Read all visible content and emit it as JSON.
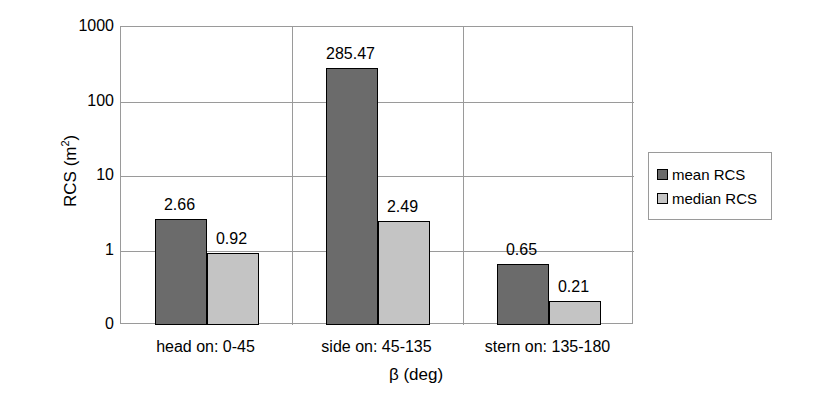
{
  "chart_data": {
    "type": "bar",
    "title": "",
    "xlabel": "β (deg)",
    "ylabel": "RCS (m²)",
    "ylabel_base": "RCS (m",
    "ylabel_sup": "2",
    "ylabel_close": ")",
    "yscale": "log",
    "ylim": [
      0,
      1000
    ],
    "yticks": [
      "1000",
      "100",
      "10",
      "1",
      "0"
    ],
    "ytick_values": [
      1000,
      100,
      10,
      1,
      0
    ],
    "grid": true,
    "legend_position": "right",
    "categories": [
      "head on:  0-45",
      "side on: 45-135",
      "stern on: 135-180"
    ],
    "series": [
      {
        "name": "mean RCS",
        "color": "#6b6b6b",
        "values": [
          2.66,
          285.47,
          0.65
        ],
        "labels": [
          "2.66",
          "285.47",
          "0.65"
        ]
      },
      {
        "name": "median RCS",
        "color": "#c4c4c4",
        "values": [
          0.92,
          2.49,
          0.21
        ],
        "labels": [
          "0.92",
          "2.49",
          "0.21"
        ]
      }
    ]
  },
  "legend": {
    "entries": [
      {
        "label": "mean RCS",
        "swatch": "mean"
      },
      {
        "label": "median RCS",
        "swatch": "median"
      }
    ]
  },
  "colors": {
    "mean": "#6b6b6b",
    "median": "#c4c4c4",
    "axis": "#9a9a9a",
    "outline": "#000000",
    "background": "#ffffff"
  }
}
